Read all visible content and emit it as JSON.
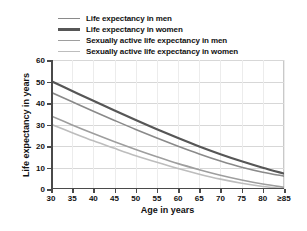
{
  "chart_data": {
    "type": "line",
    "title": "",
    "xlabel": "Age in years",
    "ylabel": "Life expectancy in years",
    "xlim": [
      30,
      85
    ],
    "ylim": [
      0,
      60
    ],
    "grid": true,
    "legend_position": "top",
    "x": [
      30,
      35,
      40,
      45,
      50,
      55,
      60,
      65,
      70,
      75,
      80,
      85
    ],
    "xticklabels": [
      "30",
      "35",
      "40",
      "45",
      "50",
      "55",
      "60",
      "65",
      "70",
      "75",
      "80",
      "≥85"
    ],
    "yticklabels": [
      "0",
      "10",
      "20",
      "30",
      "40",
      "50",
      "60"
    ],
    "yticks": [
      0,
      10,
      20,
      30,
      40,
      50,
      60
    ],
    "series": [
      {
        "name": "Life expectancy in men",
        "color": "#8a8a8a",
        "width": 1.6,
        "values": [
          45.0,
          40.6,
          36.2,
          31.9,
          27.7,
          23.7,
          19.9,
          16.3,
          13.0,
          10.1,
          7.8,
          6.0
        ]
      },
      {
        "name": "Life expectancy in women",
        "color": "#565656",
        "width": 2.2,
        "values": [
          50.2,
          45.6,
          41.0,
          36.5,
          32.1,
          27.8,
          23.7,
          19.8,
          16.2,
          12.9,
          9.9,
          7.2
        ]
      },
      {
        "name": "Sexually active life expectancy in men",
        "color": "#9e9e9e",
        "width": 1.6,
        "values": [
          34.0,
          29.8,
          25.8,
          22.0,
          18.4,
          15.0,
          11.8,
          9.0,
          6.4,
          4.2,
          2.3,
          0.8
        ]
      },
      {
        "name": "Sexually active life expectancy in women",
        "color": "#bdbdbd",
        "width": 1.6,
        "values": [
          30.1,
          26.2,
          22.4,
          18.9,
          15.5,
          12.4,
          9.5,
          6.9,
          4.6,
          2.7,
          1.2,
          0.2
        ]
      }
    ]
  },
  "legend": {
    "items": [
      {
        "label": "Life expectancy in men"
      },
      {
        "label": "Life expectancy in women"
      },
      {
        "label": "Sexually active life expectancy in men"
      },
      {
        "label": "Sexually active life expectancy in women"
      }
    ]
  },
  "axes": {
    "x_title": "Age in years",
    "y_title": "Life expectancy in years"
  }
}
